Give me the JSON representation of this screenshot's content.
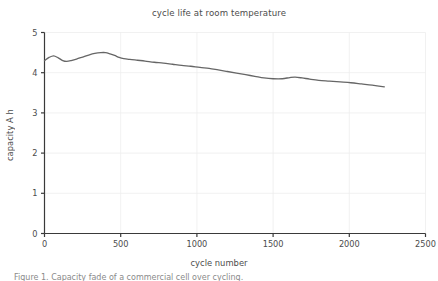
{
  "figure": {
    "title": "cycle life at room temperature",
    "caption": "Figure 1. Capacity fade of a commercial cell over cycling.",
    "background_color": "#ffffff"
  },
  "axes": {
    "x": {
      "label": "cycle number",
      "ticks": [
        0,
        500,
        1000,
        1500,
        2000,
        2500
      ],
      "tick_labels": [
        "0",
        "500",
        "1000",
        "1500",
        "2000",
        "2500"
      ],
      "limits": [
        0,
        2500
      ]
    },
    "y": {
      "label": "capacity A h",
      "ticks": [
        0,
        1,
        2,
        3,
        4,
        5
      ],
      "tick_labels": [
        "0",
        "1",
        "2",
        "3",
        "4",
        "5"
      ],
      "limits": [
        0,
        5
      ]
    },
    "grid": true,
    "grid_color": "#eeeeee",
    "spine_color": "#3a3a3a"
  },
  "chart_data": {
    "type": "line",
    "title": "cycle life at room temperature",
    "xlabel": "cycle number",
    "ylabel": "capacity A h",
    "xlim": [
      0,
      2500
    ],
    "ylim": [
      0,
      5
    ],
    "grid": true,
    "legend": null,
    "series": [
      {
        "name": "capacity",
        "color": "#666666",
        "line_width": 1.3,
        "x": [
          0,
          30,
          60,
          90,
          120,
          145,
          175,
          210,
          250,
          290,
          330,
          370,
          400,
          430,
          460,
          490,
          520,
          560,
          610,
          660,
          720,
          780,
          840,
          900,
          960,
          1020,
          1080,
          1140,
          1200,
          1260,
          1320,
          1380,
          1440,
          1500,
          1560,
          1610,
          1645,
          1690,
          1740,
          1800,
          1870,
          1940,
          2010,
          2080,
          2150,
          2230
        ],
        "y": [
          4.3,
          4.38,
          4.42,
          4.37,
          4.3,
          4.28,
          4.3,
          4.34,
          4.39,
          4.44,
          4.48,
          4.5,
          4.5,
          4.47,
          4.43,
          4.38,
          4.35,
          4.33,
          4.31,
          4.29,
          4.26,
          4.24,
          4.21,
          4.18,
          4.16,
          4.13,
          4.11,
          4.07,
          4.03,
          3.99,
          3.95,
          3.91,
          3.87,
          3.85,
          3.85,
          3.88,
          3.89,
          3.87,
          3.84,
          3.81,
          3.79,
          3.77,
          3.75,
          3.72,
          3.69,
          3.65
        ]
      }
    ]
  }
}
